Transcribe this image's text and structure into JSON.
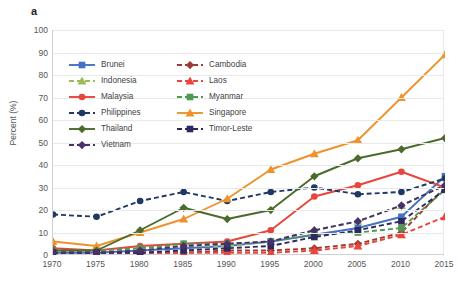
{
  "panel": {
    "label": "a"
  },
  "axes": {
    "ylabel": "Percent (%)",
    "yticks": [
      "0",
      "10",
      "20",
      "30",
      "40",
      "50",
      "60",
      "70",
      "80",
      "90",
      "100"
    ],
    "xticks": [
      "1970",
      "1975",
      "1980",
      "1985",
      "1990",
      "1995",
      "2000",
      "2005",
      "2010",
      "2015"
    ]
  },
  "legend": {
    "items": [
      {
        "label": "Brunei",
        "color": "#4372c4",
        "marker": "square",
        "dash": "solid"
      },
      {
        "label": "Cambodia",
        "color": "#9e3a33",
        "marker": "diamond",
        "dash": "dashed"
      },
      {
        "label": "Indonesia",
        "color": "#9bbb59",
        "marker": "triangle",
        "dash": "dashed"
      },
      {
        "label": "Laos",
        "color": "#e8453c",
        "marker": "triangle",
        "dash": "dashed"
      },
      {
        "label": "Malaysia",
        "color": "#e8453c",
        "marker": "circle",
        "dash": "solid"
      },
      {
        "label": "Myanmar",
        "color": "#4e9a51",
        "marker": "square",
        "dash": "dashed"
      },
      {
        "label": "Philippines",
        "color": "#1f3864",
        "marker": "circle",
        "dash": "dashed"
      },
      {
        "label": "Singapore",
        "color": "#f0922b",
        "marker": "triangle",
        "dash": "solid"
      },
      {
        "label": "Thailand",
        "color": "#4a6b2a",
        "marker": "diamond",
        "dash": "solid"
      },
      {
        "label": "Timor-Leste",
        "color": "#2f2a5e",
        "marker": "square",
        "dash": "dashed"
      },
      {
        "label": "Vietnam",
        "color": "#4a2f6e",
        "marker": "diamond",
        "dash": "dashed"
      }
    ]
  },
  "chart_data": {
    "type": "line",
    "title": "a",
    "xlabel": "",
    "ylabel": "Percent (%)",
    "xlim": [
      1970,
      2015
    ],
    "ylim": [
      0,
      100
    ],
    "grid": true,
    "legend_position": "upper-left-inside",
    "x": [
      1970,
      1975,
      1980,
      1985,
      1990,
      1995,
      2000,
      2005,
      2010,
      2015
    ],
    "series": [
      {
        "name": "Brunei",
        "color": "#4372c4",
        "marker": "square",
        "dash": "solid",
        "values": [
          1,
          1,
          2,
          3,
          4,
          6,
          9,
          12,
          17,
          35
        ]
      },
      {
        "name": "Cambodia",
        "color": "#9e3a33",
        "marker": "diamond",
        "dash": "dashed",
        "values": [
          1,
          1,
          1,
          1,
          2,
          2,
          3,
          5,
          10,
          30
        ]
      },
      {
        "name": "Indonesia",
        "color": "#9bbb59",
        "marker": "triangle",
        "dash": "dashed",
        "values": [
          2,
          2,
          3,
          4,
          4,
          6,
          11,
          15,
          22,
          31
        ]
      },
      {
        "name": "Laos",
        "color": "#e8453c",
        "marker": "triangle",
        "dash": "dashed",
        "values": [
          1,
          1,
          1,
          1,
          1,
          1,
          2,
          4,
          9,
          17
        ]
      },
      {
        "name": "Malaysia",
        "color": "#e8453c",
        "marker": "circle",
        "dash": "solid",
        "values": [
          3,
          2,
          4,
          5,
          6,
          11,
          26,
          31,
          37,
          30
        ]
      },
      {
        "name": "Myanmar",
        "color": "#4e9a51",
        "marker": "square",
        "dash": "dashed",
        "values": [
          2,
          2,
          3,
          5,
          5,
          6,
          9,
          10,
          12,
          29
        ]
      },
      {
        "name": "Philippines",
        "color": "#1f3864",
        "marker": "circle",
        "dash": "dashed",
        "values": [
          18,
          17,
          24,
          28,
          24,
          28,
          30,
          27,
          28,
          34
        ]
      },
      {
        "name": "Singapore",
        "color": "#f0922b",
        "marker": "triangle",
        "dash": "solid",
        "values": [
          6,
          4,
          10,
          16,
          25,
          38,
          45,
          51,
          70,
          89
        ]
      },
      {
        "name": "Thailand",
        "color": "#4a6b2a",
        "marker": "diamond",
        "dash": "solid",
        "values": [
          2,
          2,
          11,
          21,
          16,
          20,
          35,
          43,
          47,
          52
        ]
      },
      {
        "name": "Timor-Leste",
        "color": "#2f2a5e",
        "marker": "square",
        "dash": "dashed",
        "values": [
          1,
          1,
          1,
          2,
          3,
          4,
          8,
          11,
          15,
          29
        ]
      },
      {
        "name": "Vietnam",
        "color": "#4a2f6e",
        "marker": "diamond",
        "dash": "dashed",
        "values": [
          1,
          1,
          2,
          4,
          5,
          6,
          11,
          15,
          22,
          31
        ]
      }
    ]
  }
}
